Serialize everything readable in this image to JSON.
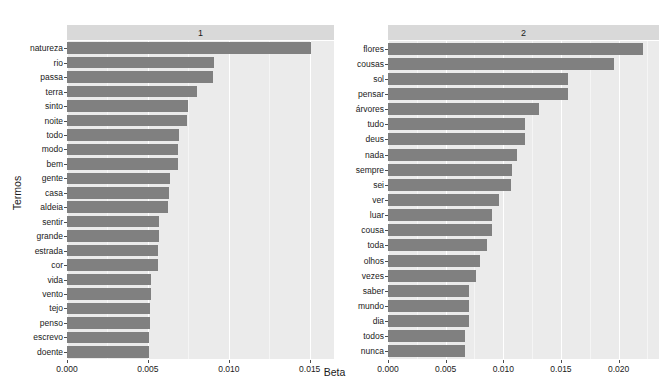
{
  "chart_data": {
    "type": "bar",
    "orientation": "horizontal",
    "title": "",
    "xlabel": "Beta",
    "ylabel": "Termos",
    "grid": true,
    "legend": "none",
    "facet_layout": "1 row x 2 columns",
    "bar_color": "#808080",
    "panel_background": "#ebebeb",
    "strip_background": "#d9d9d9",
    "panels": [
      {
        "strip_label": "1",
        "xlim": [
          0,
          0.0165
        ],
        "xticks": [
          0.0,
          0.005,
          0.01,
          0.015
        ],
        "xticklabels": [
          "0.000",
          "0.005",
          "0.010",
          "0.015"
        ],
        "categories": [
          "natureza",
          "rio",
          "passa",
          "terra",
          "sinto",
          "noite",
          "todo",
          "modo",
          "bem",
          "gente",
          "casa",
          "aldeia",
          "sentir",
          "grande",
          "estrada",
          "cor",
          "vida",
          "vento",
          "tejo",
          "penso",
          "escrevo",
          "doente"
        ],
        "values": [
          0.0151,
          0.00908,
          0.00902,
          0.00803,
          0.00745,
          0.00742,
          0.0069,
          0.00687,
          0.00683,
          0.00634,
          0.00628,
          0.00626,
          0.00571,
          0.00568,
          0.00564,
          0.0056,
          0.00521,
          0.00518,
          0.00514,
          0.00511,
          0.00508,
          0.00505
        ]
      },
      {
        "strip_label": "2",
        "xlim": [
          0,
          0.0235
        ],
        "xticks": [
          0.0,
          0.005,
          0.01,
          0.015,
          0.02
        ],
        "xticklabels": [
          "0.000",
          "0.005",
          "0.010",
          "0.015",
          "0.020"
        ],
        "categories": [
          "flores",
          "cousas",
          "sol",
          "pensar",
          "árvores",
          "tudo",
          "deus",
          "nada",
          "sempre",
          "sei",
          "ver",
          "luar",
          "cousa",
          "toda",
          "olhos",
          "vezes",
          "saber",
          "mundo",
          "dia",
          "todos",
          "nunca"
        ],
        "values": [
          0.0221,
          0.0196,
          0.01562,
          0.01558,
          0.01312,
          0.0119,
          0.01185,
          0.01115,
          0.01075,
          0.0107,
          0.0096,
          0.00905,
          0.009,
          0.00855,
          0.008,
          0.0076,
          0.00705,
          0.00702,
          0.007,
          0.0067,
          0.00665
        ]
      }
    ]
  },
  "axis_titles": {
    "x": "Beta",
    "y": "Termos"
  }
}
